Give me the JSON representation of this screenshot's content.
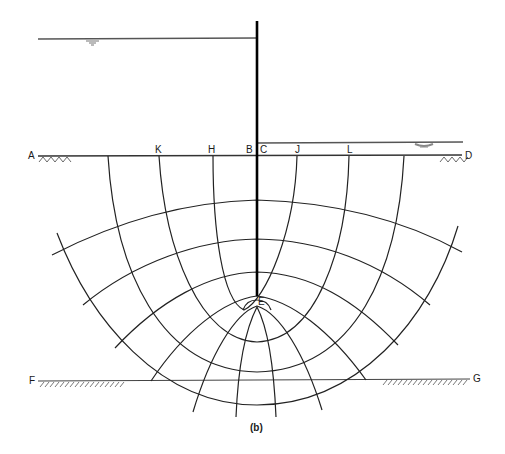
{
  "figure": {
    "caption": "(b)",
    "colors": {
      "ink": "#1a1a1a",
      "water_line": "#555555",
      "background": "#ffffff"
    }
  },
  "labels": {
    "A": "A",
    "K": "K",
    "H": "H",
    "B": "B",
    "C": "C",
    "J": "J",
    "L": "L",
    "D": "D",
    "E": "E",
    "F": "F",
    "G": "G"
  },
  "elements": {
    "sheet_pile": "sheet-pile",
    "upstream_water_level": "upstream-water-level",
    "downstream_water_level": "downstream-water-level",
    "ground_surface": "ground-surface-AD",
    "impermeable_layer": "impermeable-layer-FG",
    "flow_lines_count": 4,
    "equipotential_lines_count": 7
  }
}
